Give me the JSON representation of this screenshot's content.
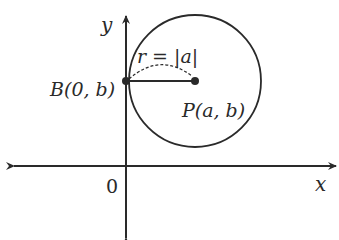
{
  "diagram": {
    "type": "coordinate-geometry",
    "axes": {
      "x_label": "x",
      "y_label": "y",
      "origin_label": "0"
    },
    "circle": {
      "center_label": "P(a, b)",
      "tangent_point_label": "B(0, b)",
      "radius_label": "r = |a|"
    },
    "colors": {
      "stroke": "#2a2a2a",
      "background": "#ffffff"
    }
  }
}
